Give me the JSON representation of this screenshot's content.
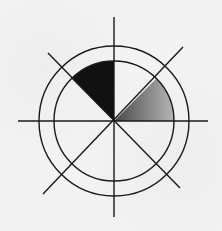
{
  "diagram": {
    "type": "polar-sector-diagram",
    "center": {
      "x": 114,
      "y": 121
    },
    "circles": [
      {
        "name": "inner-circle",
        "r": 60
      },
      {
        "name": "outer-circle",
        "r": 75
      }
    ],
    "axes": [
      {
        "name": "horizontal-axis",
        "x1": 18,
        "y1": 121,
        "x2": 208,
        "y2": 121
      },
      {
        "name": "vertical-axis",
        "x1": 114,
        "y1": 17,
        "x2": 114,
        "y2": 217
      },
      {
        "name": "diagonal-nw-se",
        "x1": 48,
        "y1": 53,
        "x2": 180,
        "y2": 188
      },
      {
        "name": "diagonal-ne-sw",
        "x1": 183,
        "y1": 47,
        "x2": 43,
        "y2": 194
      }
    ],
    "sectors": [
      {
        "name": "black-sector",
        "start_deg": 90,
        "end_deg": 135,
        "r": 60,
        "fill": "#111111"
      },
      {
        "name": "gradient-sector",
        "start_deg": 0,
        "end_deg": 45,
        "r": 60,
        "gradient_from": "#4a4a4a",
        "gradient_to": "#b5b5b5"
      }
    ],
    "colors": {
      "background": "#f3f3f3",
      "stroke": "#1a1a1a"
    }
  }
}
